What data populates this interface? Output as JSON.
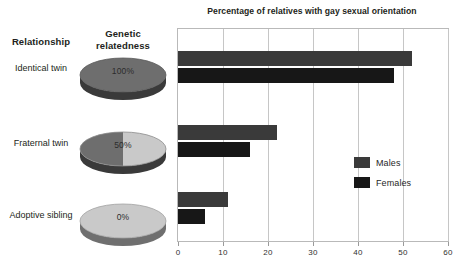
{
  "chart_data": {
    "type": "bar",
    "orientation": "horizontal",
    "title": "Percentage of relatives with gay sexual orientation",
    "categories": [
      "Identical twin",
      "Fraternal twin",
      "Adoptive sibling"
    ],
    "series": [
      {
        "name": "Males",
        "color": "#3a3a3a",
        "values": [
          52,
          22,
          11
        ]
      },
      {
        "name": "Females",
        "color": "#171717",
        "values": [
          48,
          16,
          6
        ]
      }
    ],
    "xlabel": "",
    "ylabel": "",
    "xlim": [
      0,
      60
    ],
    "xticks": [
      0,
      10,
      20,
      30,
      40,
      50,
      60
    ],
    "xtick_labels": [
      "0",
      "10",
      "20",
      "30",
      "40",
      "50",
      "60"
    ],
    "grid": true,
    "legend_position": "inside-right"
  },
  "left_panel": {
    "headers": {
      "relationship": "Relationship",
      "genetic": "Genetic relatedness"
    },
    "rows": [
      {
        "relationship": "Identical twin",
        "relatedness_label": "100%",
        "relatedness_value": 100
      },
      {
        "relationship": "Fraternal twin",
        "relatedness_label": "50%",
        "relatedness_value": 50
      },
      {
        "relationship": "Adoptive sibling",
        "relatedness_label": "0%",
        "relatedness_value": 0
      }
    ]
  },
  "colors": {
    "pie_filled": "#6e6e6e",
    "pie_empty": "#c9c9c9",
    "pie_rim_dark": "#3a3a3a",
    "pie_rim_light": "#9a9a9a",
    "bar_males": "#3a3a3a",
    "bar_females": "#171717",
    "grid": "#c6c6c6",
    "frame": "#b9b9b9"
  }
}
